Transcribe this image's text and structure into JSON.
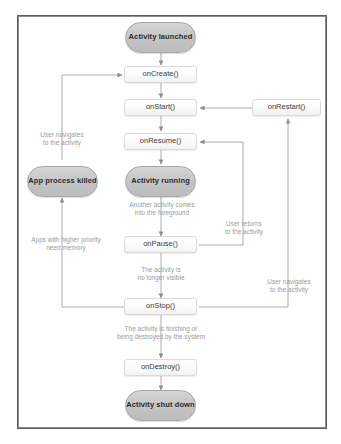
{
  "diagram": {
    "type": "flowchart",
    "frame": {
      "border_color": "#5a5a5a",
      "background": "#ffffff"
    },
    "palette": {
      "state_fill": "#c6c6c6",
      "state_border": "#a7a7a7",
      "callback_fill": "#fbfbfb",
      "callback_border": "#dadada",
      "annotation_text": "#9a9a9a",
      "wire": "#a2a2a2"
    }
  },
  "states": [
    {
      "id": "activity_launched",
      "label": "Activity\nlaunched",
      "shape": "rounded"
    },
    {
      "id": "app_process_killed",
      "label": "App process\nkilled",
      "shape": "rounded"
    },
    {
      "id": "activity_running",
      "label": "Activity\nrunning",
      "shape": "rounded"
    },
    {
      "id": "activity_shut_down",
      "label": "Activity\nshut down",
      "shape": "rounded"
    }
  ],
  "callbacks": [
    {
      "id": "on_create",
      "label": "onCreate()"
    },
    {
      "id": "on_start",
      "label": "onStart()"
    },
    {
      "id": "on_restart",
      "label": "onRestart()"
    },
    {
      "id": "on_resume",
      "label": "onResume()"
    },
    {
      "id": "on_pause",
      "label": "onPause()"
    },
    {
      "id": "on_stop",
      "label": "onStop()"
    },
    {
      "id": "on_destroy",
      "label": "onDestroy()"
    }
  ],
  "annotations": [
    {
      "id": "user_navigates_left",
      "text": "User navigates\nto the activity"
    },
    {
      "id": "another_activity_foreground",
      "text": "Another activity comes\ninto the foreground"
    },
    {
      "id": "user_returns",
      "text": "User returns\nto the activity"
    },
    {
      "id": "apps_higher_priority",
      "text": "Apps with higher priority\nneed memory"
    },
    {
      "id": "no_longer_visible",
      "text": "The activity is\nno longer visible"
    },
    {
      "id": "user_navigates_right",
      "text": "User navigates\nto the activity"
    },
    {
      "id": "finishing_or_destroyed",
      "text": "The activity is finishing or\nbeing destroyed by the system"
    }
  ]
}
